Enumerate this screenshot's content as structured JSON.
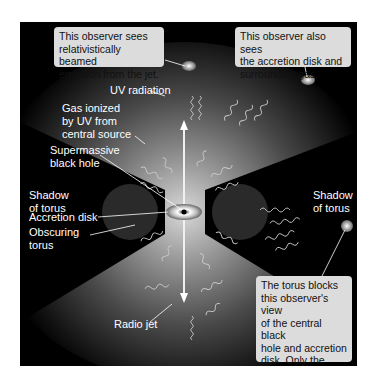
{
  "diagram": {
    "colors": {
      "background": "#000000",
      "gas_glow": "#8a8a8a",
      "callout_bg": "#dcdcdc",
      "callout_text": "#111111",
      "label_text": "#ffffff"
    },
    "callouts": {
      "jet_observer": "This observer sees\nrelativistically beamed\nemission from the jet.",
      "disk_observer": "This observer also sees\nthe accretion disk and\nsurrounding gas.",
      "torus_observer": "The torus blocks\nthis observer's view\nof the central black\nhole and accretion\ndisk. Only the\nextended region of\nemission is seen."
    },
    "labels": {
      "uv_radiation": "UV radiation",
      "gas_ionized": "Gas ionized\nby UV from\ncentral source",
      "black_hole": "Supermassive\nblack hole",
      "shadow_left": "Shadow\nof torus",
      "shadow_right": "Shadow\nof torus",
      "accretion_disk": "Accretion disk",
      "obscuring_torus": "Obscuring\ntorus",
      "radio_jet": "Radio jet"
    }
  }
}
